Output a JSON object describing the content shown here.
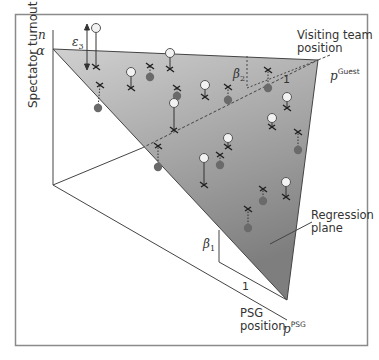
{
  "figure": {
    "y_axis_label": "Spectator turnout",
    "y_axis_var": "n",
    "intercept_label": "α",
    "error_label": "ε",
    "error_sub": "3",
    "visiting_label_line1": "Visiting team",
    "visiting_label_line2": "position",
    "guest_var": "p",
    "guest_sup": "Guest",
    "beta2_label": "β",
    "beta2_sub": "2",
    "beta1_label": "β",
    "beta1_sub": "1",
    "unit_label_guest": "1",
    "unit_label_psg": "1",
    "plane_label_line1": "Regression",
    "plane_label_line2": "plane",
    "psg_label_line1": "PSG",
    "psg_label_line2": "position",
    "psg_var": "p",
    "psg_sup": "PSG"
  },
  "colors": {
    "plane_top": "#d0d0d0",
    "plane_bottom": "#7e7e7e",
    "frame": "#8a8a8a",
    "line": "#444444",
    "point_above_fill": "#f2f2f2",
    "point_below_fill": "#6a6a6a"
  },
  "points": [
    {
      "type": "above",
      "x": 96,
      "y": 28,
      "px": 96,
      "py": 67
    },
    {
      "type": "below",
      "x": 98,
      "y": 108,
      "px": 100,
      "py": 85
    },
    {
      "type": "above",
      "x": 131,
      "y": 72,
      "px": 131,
      "py": 88
    },
    {
      "type": "below",
      "x": 150,
      "y": 77,
      "px": 150,
      "py": 66
    },
    {
      "type": "above",
      "x": 170,
      "y": 53,
      "px": 170,
      "py": 69
    },
    {
      "type": "below",
      "x": 177,
      "y": 96,
      "px": 177,
      "py": 88
    },
    {
      "type": "above",
      "x": 174,
      "y": 103,
      "px": 174,
      "py": 130
    },
    {
      "type": "below",
      "x": 158,
      "y": 167,
      "px": 158,
      "py": 146
    },
    {
      "type": "above",
      "x": 205,
      "y": 85,
      "px": 205,
      "py": 97
    },
    {
      "type": "below",
      "x": 228,
      "y": 100,
      "px": 228,
      "py": 87
    },
    {
      "type": "below",
      "x": 268,
      "y": 88,
      "px": 268,
      "py": 70
    },
    {
      "type": "above",
      "x": 287,
      "y": 97,
      "px": 287,
      "py": 108
    },
    {
      "type": "above",
      "x": 272,
      "y": 118,
      "px": 272,
      "py": 127
    },
    {
      "type": "above",
      "x": 228,
      "y": 138,
      "px": 228,
      "py": 147
    },
    {
      "type": "below",
      "x": 220,
      "y": 165,
      "px": 220,
      "py": 155
    },
    {
      "type": "below",
      "x": 298,
      "y": 150,
      "px": 298,
      "py": 132
    },
    {
      "type": "above",
      "x": 204,
      "y": 158,
      "px": 204,
      "py": 185
    },
    {
      "type": "above",
      "x": 286,
      "y": 182,
      "px": 286,
      "py": 197
    },
    {
      "type": "below",
      "x": 263,
      "y": 201,
      "px": 263,
      "py": 189
    },
    {
      "type": "below",
      "x": 248,
      "y": 228,
      "px": 248,
      "py": 209
    }
  ]
}
